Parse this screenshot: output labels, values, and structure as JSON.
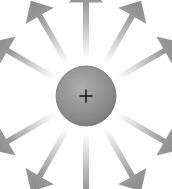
{
  "figure": {
    "title": "Electric field of a positive point charge",
    "background_color": "#ffffff",
    "width": 172,
    "height": 189
  },
  "charge": {
    "label": "+",
    "polarity": "positive",
    "center_x": 86,
    "center_y": 96,
    "radius": 30,
    "fill_light": "#a9a9a9",
    "fill_mid": "#8e8e8e",
    "fill_dark": "#6f6f6f",
    "edge_color": "#5f5f5f",
    "sign_color": "#141414"
  },
  "field_lines": {
    "count": 12,
    "arrow_color_tip": "#8d8d8d",
    "arrow_color_tail": "#ffffff",
    "direction": "outward",
    "inner_radius": 32,
    "arrows": [
      {
        "name": "field-arrow-up",
        "angle_deg": -90,
        "length": 80,
        "width": 6.0
      },
      {
        "name": "field-arrow-up-right-30",
        "angle_deg": -60,
        "length": 78,
        "width": 5.6
      },
      {
        "name": "field-arrow-up-right-60",
        "angle_deg": -30,
        "length": 76,
        "width": 5.6
      },
      {
        "name": "field-arrow-right",
        "angle_deg": 0,
        "length": 0,
        "width": 0
      },
      {
        "name": "field-arrow-down-right-60",
        "angle_deg": 30,
        "length": 76,
        "width": 5.6
      },
      {
        "name": "field-arrow-down-right-30",
        "angle_deg": 60,
        "length": 78,
        "width": 5.6
      },
      {
        "name": "field-arrow-down",
        "angle_deg": 90,
        "length": 80,
        "width": 6.0
      },
      {
        "name": "field-arrow-down-left-30",
        "angle_deg": 120,
        "length": 78,
        "width": 5.6
      },
      {
        "name": "field-arrow-down-left-60",
        "angle_deg": 150,
        "length": 76,
        "width": 5.6
      },
      {
        "name": "field-arrow-left",
        "angle_deg": 180,
        "length": 0,
        "width": 0
      },
      {
        "name": "field-arrow-up-left-60",
        "angle_deg": -150,
        "length": 76,
        "width": 5.6
      },
      {
        "name": "field-arrow-up-left-30",
        "angle_deg": -120,
        "length": 78,
        "width": 5.6
      }
    ]
  }
}
